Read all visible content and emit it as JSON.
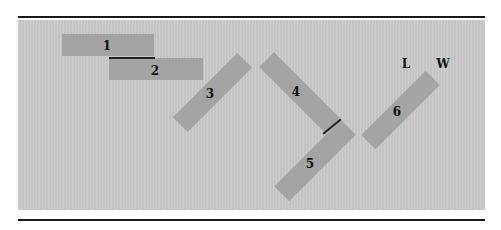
{
  "figure": {
    "background_color": "#c9c9c9",
    "rect_color": "#a4a4a4",
    "rule_color": "#1a1a1a",
    "rectangles": [
      {
        "id": "1",
        "label": "1",
        "cx": 108,
        "cy": 45,
        "length": 92,
        "width": 22,
        "angle": 0,
        "label_x": 107,
        "label_y": 46
      },
      {
        "id": "2",
        "label": "2",
        "cx": 156,
        "cy": 69,
        "length": 94,
        "width": 22,
        "angle": 0,
        "label_x": 155,
        "label_y": 71
      },
      {
        "id": "3",
        "label": "3",
        "cx": 212,
        "cy": 92,
        "length": 91,
        "width": 21,
        "angle": -45,
        "label_x": 210,
        "label_y": 94
      },
      {
        "id": "4",
        "label": "4",
        "cx": 299,
        "cy": 92,
        "length": 93,
        "width": 21,
        "angle": 45,
        "label_x": 296,
        "label_y": 92
      },
      {
        "id": "5",
        "label": "5",
        "cx": 315,
        "cy": 160,
        "length": 94,
        "width": 21,
        "angle": -45,
        "label_x": 310,
        "label_y": 164
      },
      {
        "id": "6",
        "label": "6",
        "cx": 400,
        "cy": 110,
        "length": 91,
        "width": 20,
        "angle": -45,
        "label_x": 397,
        "label_y": 112
      }
    ],
    "joints": [
      {
        "id": "joint-1-2",
        "x1": 109,
        "y1": 57,
        "x2": 155,
        "y2": 57
      },
      {
        "id": "joint-4-5",
        "x1": 323,
        "y1": 133,
        "x2": 341,
        "y2": 118
      }
    ],
    "annotations": [
      {
        "id": "L",
        "text": "L",
        "x": 406,
        "y": 64
      },
      {
        "id": "W",
        "text": "W",
        "x": 443,
        "y": 64
      }
    ]
  }
}
